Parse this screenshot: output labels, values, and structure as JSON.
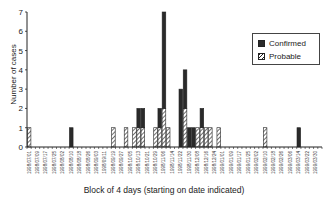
{
  "chart_data": {
    "type": "bar",
    "stacked": true,
    "title": "",
    "xlabel": "Block of 4 days (starting on date indicated)",
    "ylabel": "Number of cases",
    "ylim": [
      0,
      7
    ],
    "yticks": [
      0,
      1,
      2,
      3,
      4,
      5,
      6,
      7
    ],
    "legend": {
      "position": "upper right",
      "entries": [
        "Confirmed",
        "Probable"
      ]
    },
    "tick_labels": [
      "1998/07/01",
      "1998/07/09",
      "1998/07/17",
      "1998/07/25",
      "1998/08/02",
      "1998/08/10",
      "1998/08/18",
      "1998/08/26",
      "1998/09/03",
      "1998/09/11",
      "1998/09/19",
      "1998/09/27",
      "1998/10/05",
      "1998/10/13",
      "1998/10/21",
      "1998/10/29",
      "1998/11/06",
      "1998/11/14",
      "1998/11/22",
      "1998/11/30",
      "1998/12/08",
      "1998/12/16",
      "1998/12/24",
      "1999/01/01",
      "1999/01/09",
      "1999/01/17",
      "1999/01/25",
      "1999/02/02",
      "1999/02/10",
      "1999/02/18",
      "1999/02/26",
      "1999/03/06",
      "1999/03/14",
      "1999/03/22",
      "1999/03/30"
    ],
    "n_blocks": 70,
    "series": [
      {
        "name": "Confirmed",
        "color": "#2a2a2a",
        "points": [
          {
            "block": 10,
            "value": 1
          },
          {
            "block": 26,
            "value": 1
          },
          {
            "block": 27,
            "value": 1
          },
          {
            "block": 31,
            "value": 1
          },
          {
            "block": 32,
            "value": 5
          },
          {
            "block": 36,
            "value": 3
          },
          {
            "block": 37,
            "value": 2
          },
          {
            "block": 38,
            "value": 1
          },
          {
            "block": 39,
            "value": 1
          },
          {
            "block": 41,
            "value": 1
          },
          {
            "block": 64,
            "value": 1
          }
        ]
      },
      {
        "name": "Probable",
        "color": "hatched",
        "points": [
          {
            "block": 0,
            "value": 1
          },
          {
            "block": 20,
            "value": 1
          },
          {
            "block": 23,
            "value": 1
          },
          {
            "block": 25,
            "value": 1
          },
          {
            "block": 26,
            "value": 1
          },
          {
            "block": 27,
            "value": 1
          },
          {
            "block": 30,
            "value": 1
          },
          {
            "block": 31,
            "value": 1
          },
          {
            "block": 32,
            "value": 2
          },
          {
            "block": 33,
            "value": 1
          },
          {
            "block": 37,
            "value": 2
          },
          {
            "block": 40,
            "value": 1
          },
          {
            "block": 41,
            "value": 1
          },
          {
            "block": 42,
            "value": 1
          },
          {
            "block": 43,
            "value": 1
          },
          {
            "block": 45,
            "value": 1
          },
          {
            "block": 56,
            "value": 1
          }
        ]
      }
    ]
  },
  "labels": {
    "ylabel": "Number of cases",
    "xlabel": "Block of 4 days (starting on date indicated)",
    "legend_confirmed": "Confirmed",
    "legend_probable": "Probable"
  }
}
